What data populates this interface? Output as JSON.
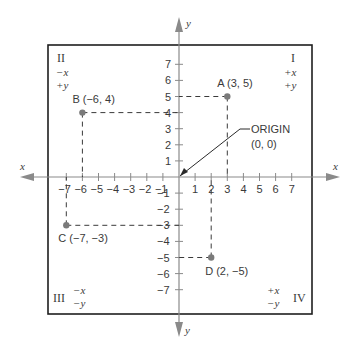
{
  "diagram": {
    "axes": {
      "x_label": "x",
      "y_label": "y",
      "x_ticks": [
        -7,
        -6,
        -5,
        -4,
        -3,
        -2,
        -1,
        1,
        2,
        3,
        4,
        5,
        6,
        7
      ],
      "y_ticks": [
        7,
        6,
        5,
        4,
        3,
        2,
        1,
        -1,
        -2,
        -3,
        -4,
        -5,
        -6,
        -7
      ],
      "range": [
        -7,
        7
      ]
    },
    "quadrants": [
      {
        "id": "I",
        "numeral": "I",
        "x_sign": "+x",
        "y_sign": "+y"
      },
      {
        "id": "II",
        "numeral": "II",
        "x_sign": "−x",
        "y_sign": "+y"
      },
      {
        "id": "III",
        "numeral": "III",
        "x_sign": "−x",
        "y_sign": "−y"
      },
      {
        "id": "IV",
        "numeral": "IV",
        "x_sign": "+x",
        "y_sign": "−y"
      }
    ],
    "points": [
      {
        "name": "A",
        "label": "A (3, 5)",
        "x": 3,
        "y": 5
      },
      {
        "name": "B",
        "label": "B (−6, 4)",
        "x": -6,
        "y": 4
      },
      {
        "name": "C",
        "label": "C (−7, −3)",
        "x": -7,
        "y": -3
      },
      {
        "name": "D",
        "label": "D (2, −5)",
        "x": 2,
        "y": -5
      }
    ],
    "origin": {
      "label": "ORIGIN",
      "coords": "(0, 0)"
    },
    "colors": {
      "ink": "#3a3a3a",
      "axis": "#8a8a8a",
      "point": "#7a7a7a",
      "border": "#1e1e1e"
    }
  }
}
